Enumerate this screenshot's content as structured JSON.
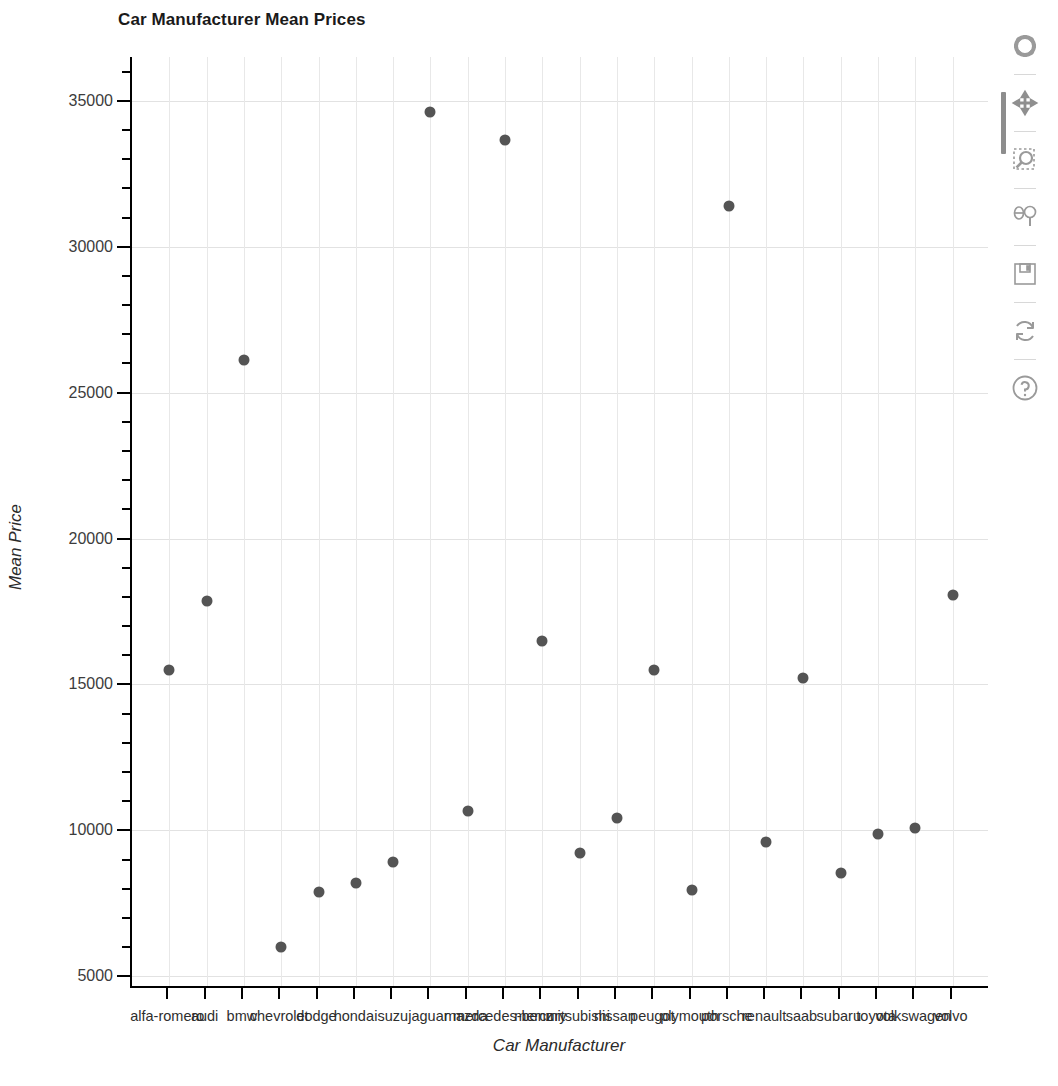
{
  "chart_data": {
    "type": "scatter",
    "title": "Car Manufacturer Mean Prices",
    "xlabel": "Car Manufacturer",
    "ylabel": "Mean Price",
    "grid": true,
    "legend": null,
    "ylim": [
      4600,
      36500
    ],
    "y_ticks_major": [
      5000,
      10000,
      15000,
      20000,
      25000,
      30000,
      35000
    ],
    "y_tick_minor_step": 1000,
    "marker_color": "#545454",
    "grid_color": "#e2e2e2",
    "categories": [
      "alfa-romero",
      "audi",
      "bmw",
      "chevrolet",
      "dodge",
      "honda",
      "isuzu",
      "jaguar",
      "mazda",
      "mercedes-benz",
      "mercury",
      "mitsubishi",
      "nissan",
      "peugot",
      "plymouth",
      "porsche",
      "renault",
      "saab",
      "subaru",
      "toyota",
      "volkswagen",
      "volvo"
    ],
    "values": [
      15498,
      17859,
      26118,
      6007,
      7875,
      8185,
      8916,
      34600,
      10652,
      33647,
      16503,
      9239,
      10415,
      15489,
      7963,
      31400,
      9595,
      15223,
      8541,
      9885,
      10077,
      18063
    ],
    "points": [
      {
        "category": "alfa-romero",
        "value": 15498
      },
      {
        "category": "audi",
        "value": 17859
      },
      {
        "category": "bmw",
        "value": 26118
      },
      {
        "category": "chevrolet",
        "value": 6007
      },
      {
        "category": "dodge",
        "value": 7875
      },
      {
        "category": "honda",
        "value": 8185
      },
      {
        "category": "isuzu",
        "value": 8916
      },
      {
        "category": "jaguar",
        "value": 34600
      },
      {
        "category": "mazda",
        "value": 10652
      },
      {
        "category": "mercedes-benz",
        "value": 33647
      },
      {
        "category": "mercury",
        "value": 16503
      },
      {
        "category": "mitsubishi",
        "value": 9239
      },
      {
        "category": "nissan",
        "value": 10415
      },
      {
        "category": "peugot",
        "value": 15489
      },
      {
        "category": "plymouth",
        "value": 7963
      },
      {
        "category": "porsche",
        "value": 31400
      },
      {
        "category": "renault",
        "value": 9595
      },
      {
        "category": "saab",
        "value": 15223
      },
      {
        "category": "subaru",
        "value": 8541
      },
      {
        "category": "toyota",
        "value": 9885
      },
      {
        "category": "volkswagen",
        "value": 10077
      },
      {
        "category": "volvo",
        "value": 18063
      }
    ]
  },
  "toolbar": {
    "items": [
      {
        "name": "home-icon",
        "label": "Reset original view"
      },
      {
        "name": "pan-icon",
        "label": "Pan axes with left mouse, zoom with right"
      },
      {
        "name": "zoom-rect-icon",
        "label": "Zoom to rectangle"
      },
      {
        "name": "subplots-icon",
        "label": "Configure subplots"
      },
      {
        "name": "save-icon",
        "label": "Save the figure"
      },
      {
        "name": "refresh-icon",
        "label": "Refresh"
      },
      {
        "name": "help-icon",
        "label": "Help"
      }
    ]
  }
}
